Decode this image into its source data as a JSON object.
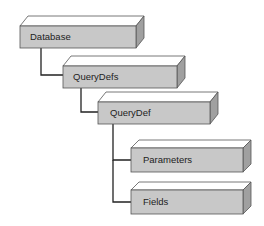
{
  "diagram": {
    "nodes": [
      {
        "id": "database",
        "label": "Database"
      },
      {
        "id": "querydefs",
        "label": "QueryDefs"
      },
      {
        "id": "querydef",
        "label": "QueryDef"
      },
      {
        "id": "parameters",
        "label": "Parameters"
      },
      {
        "id": "fields",
        "label": "Fields"
      }
    ],
    "edges": [
      {
        "from": "database",
        "to": "querydefs"
      },
      {
        "from": "querydefs",
        "to": "querydef"
      },
      {
        "from": "querydef",
        "to": "parameters"
      },
      {
        "from": "querydef",
        "to": "fields"
      }
    ],
    "colors": {
      "box_front": "#c8c8c8",
      "box_top": "#ffffff",
      "box_side": "#a0a0a0",
      "line": "#222222"
    }
  }
}
